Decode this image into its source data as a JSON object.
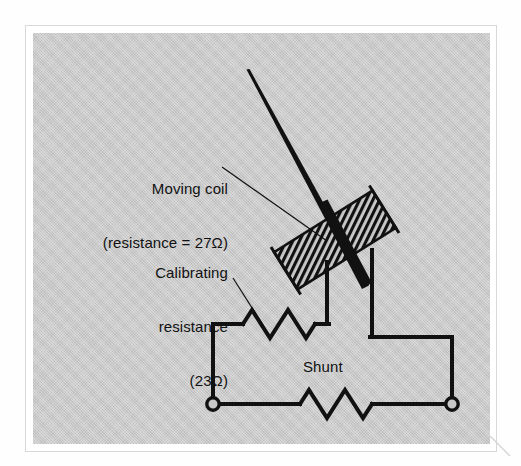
{
  "figure": {
    "kind": "circuit-schematic",
    "background_color": "#c9c9c9",
    "page_color": "#ffffff",
    "ink_color": "#111111",
    "border_color": "#d8d8d8"
  },
  "labels": {
    "moving_coil": {
      "line1": "Moving coil",
      "line2": "(resistance = 27Ω)",
      "full": "Moving coil\n(resistance = 27Ω)"
    },
    "calibrating_resistance": {
      "line1": "Calibrating",
      "line2": "resistance",
      "line3": "(23Ω)",
      "full": "Calibrating\nresistance\n(23Ω)"
    },
    "shunt": "Shunt"
  },
  "components": {
    "moving_coil": {
      "name": "moving-coil",
      "resistance_ohms": 27,
      "resistance_text": "27Ω",
      "style": "hatched-rotated-rectangle",
      "rotation_deg": -32
    },
    "calibrating_resistor": {
      "name": "calibrating-resistance",
      "resistance_ohms": 23,
      "resistance_text": "23Ω",
      "style": "zigzag-resistor",
      "peaks": 3
    },
    "shunt_resistor": {
      "name": "shunt-resistor",
      "style": "zigzag-resistor",
      "peaks": 3
    },
    "pointer": {
      "name": "meter-pointer-needle",
      "style": "tapered-needle"
    },
    "terminals": [
      {
        "name": "terminal-left",
        "style": "open-circle"
      },
      {
        "name": "terminal-right",
        "style": "open-circle"
      }
    ]
  }
}
